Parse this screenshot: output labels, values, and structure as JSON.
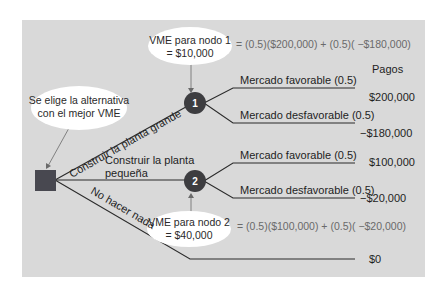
{
  "colors": {
    "panel": "#d9d9d9",
    "node": "#3d3d40",
    "decision": "#484850",
    "line": "#2b2b2b",
    "bubble": "#ffffff",
    "formula_text": "#6a6a6a"
  },
  "decision_node": {
    "label": "Se elige la alternativa con el mejor VME",
    "line1": "Se elige la alternativa",
    "line2": "con el mejor VME"
  },
  "alternatives": [
    {
      "label": "Construir la planta grande"
    },
    {
      "label_line1": "Construir la planta",
      "label_line2": "pequeña"
    },
    {
      "label": "No hacer nada"
    }
  ],
  "chance_nodes": [
    {
      "id": "1",
      "vme_line1": "VME para nodo 1",
      "vme_line2": "= $10,000",
      "formula": "= (0.5)($200,000) + (0.5)( −$180,000)",
      "branches": [
        {
          "label": "Mercado favorable (0.5)",
          "payoff": "$200,000"
        },
        {
          "label": "Mercado desfavorable (0.5)",
          "payoff": "−$180,000"
        }
      ]
    },
    {
      "id": "2",
      "vme_line1": "VME para nodo 2",
      "vme_line2": "= $40,000",
      "formula": "= (0.5)($100,000) + (0.5)( −$20,000)",
      "branches": [
        {
          "label": "Mercado favorable (0.5)",
          "payoff": "$100,000"
        },
        {
          "label": "Mercado desfavorable (0.5)",
          "payoff": "−$20,000"
        }
      ]
    }
  ],
  "payoffs_header": "Pagos",
  "no_action_payoff": "$0"
}
